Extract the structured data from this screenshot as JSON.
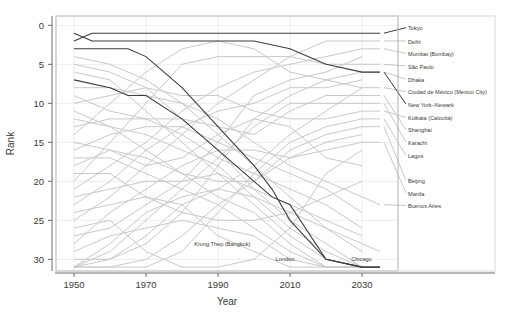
{
  "chart_data": {
    "type": "line",
    "title": "",
    "xlabel": "Year",
    "ylabel": "Rank",
    "xlim": [
      1945,
      2040
    ],
    "ylim": [
      31.5,
      -1.2
    ],
    "y_inverted": true,
    "grid": true,
    "legend_position": "right-of-plot (direct line labels)",
    "xticks": [
      1950,
      1970,
      1990,
      2010,
      2030
    ],
    "yticks": [
      0,
      5,
      10,
      15,
      20,
      25,
      30
    ],
    "colors": {
      "highlight": "#3d3d3d",
      "muted": "#c9c9c9",
      "axis": "#6d6d6d",
      "grid": "#ededf2",
      "frame": "#b0b0b0",
      "text": "#3a3a3a"
    },
    "series": [
      {
        "name": "Tokyo",
        "highlight": true,
        "label_rank": 0.3,
        "x": [
          1950,
          1955,
          1960,
          1970,
          1980,
          1990,
          2000,
          2010,
          2020,
          2030,
          2035
        ],
        "values": [
          2,
          1,
          1,
          1,
          1,
          1,
          1,
          1,
          1,
          1,
          1
        ]
      },
      {
        "name": "Delhi",
        "highlight": false,
        "label_rank": 2.0,
        "x": [
          1950,
          1960,
          1970,
          1980,
          1990,
          2000,
          2010,
          2020,
          2030,
          2035
        ],
        "values": [
          25,
          22,
          18,
          14,
          10,
          7,
          4,
          2,
          2,
          2
        ]
      },
      {
        "name": "Mumbai (Bombay)",
        "highlight": false,
        "label_rank": 3.6,
        "x": [
          1950,
          1960,
          1970,
          1980,
          1990,
          2000,
          2010,
          2020,
          2030,
          2035
        ],
        "values": [
          21,
          18,
          15,
          11,
          8,
          6,
          5,
          4,
          3,
          3
        ]
      },
      {
        "name": "São Paulo",
        "highlight": false,
        "label_rank": 5.2,
        "x": [
          1950,
          1960,
          1970,
          1980,
          1990,
          2000,
          2010,
          2020,
          2030,
          2035
        ],
        "values": [
          20,
          15,
          10,
          5,
          4,
          4,
          4,
          5,
          5,
          5
        ]
      },
      {
        "name": "Dhaka",
        "highlight": false,
        "label_rank": 6.9,
        "x": [
          1950,
          1960,
          1970,
          1980,
          1990,
          2000,
          2010,
          2020,
          2030,
          2035
        ],
        "values": [
          30,
          30,
          28,
          24,
          18,
          12,
          9,
          7,
          6,
          6
        ]
      },
      {
        "name": "Ciudad de México (Mexico City)",
        "highlight": false,
        "label_rank": 8.5,
        "x": [
          1950,
          1960,
          1970,
          1980,
          1990,
          2000,
          2010,
          2020,
          2030,
          2035
        ],
        "values": [
          14,
          10,
          6,
          3,
          2,
          3,
          6,
          7,
          8,
          8
        ]
      },
      {
        "name": "New York–Newark",
        "highlight": true,
        "label_rank": 10.1,
        "x": [
          1950,
          1955,
          1960,
          1970,
          1980,
          1990,
          2000,
          2010,
          2020,
          2030,
          2035
        ],
        "values": [
          1,
          2,
          2,
          2,
          2,
          2,
          2,
          3,
          5,
          6,
          6
        ]
      },
      {
        "name": "Kolkata (Calcutta)",
        "highlight": false,
        "label_rank": 11.8,
        "x": [
          1950,
          1960,
          1970,
          1980,
          1990,
          2000,
          2010,
          2020,
          2030,
          2035
        ],
        "values": [
          10,
          9,
          8,
          9,
          9,
          11,
          12,
          12,
          11,
          11
        ]
      },
      {
        "name": "Shanghai",
        "highlight": false,
        "label_rank": 13.4,
        "x": [
          1950,
          1960,
          1970,
          1980,
          1990,
          2000,
          2010,
          2020,
          2030,
          2035
        ],
        "values": [
          9,
          11,
          12,
          12,
          13,
          14,
          11,
          9,
          9,
          9
        ]
      },
      {
        "name": "Karachi",
        "highlight": false,
        "label_rank": 15.0,
        "x": [
          1950,
          1960,
          1970,
          1980,
          1990,
          2000,
          2010,
          2020,
          2030,
          2035
        ],
        "values": [
          31,
          29,
          25,
          21,
          17,
          13,
          10,
          10,
          10,
          10
        ]
      },
      {
        "name": "Lagos",
        "highlight": false,
        "label_rank": 16.7,
        "x": [
          1950,
          1960,
          1970,
          1980,
          1990,
          2000,
          2010,
          2020,
          2030,
          2035
        ],
        "values": [
          31,
          31,
          31,
          29,
          24,
          19,
          15,
          13,
          12,
          12
        ]
      },
      {
        "name": "Beijing",
        "highlight": false,
        "label_rank": 19.9,
        "x": [
          1950,
          1960,
          1970,
          1980,
          1990,
          2000,
          2010,
          2020,
          2030,
          2035
        ],
        "values": [
          18,
          16,
          17,
          19,
          20,
          20,
          16,
          14,
          13,
          13
        ]
      },
      {
        "name": "Manila",
        "highlight": false,
        "label_rank": 21.5,
        "x": [
          1950,
          1960,
          1970,
          1980,
          1990,
          2000,
          2010,
          2020,
          2030,
          2035
        ],
        "values": [
          28,
          24,
          21,
          18,
          16,
          16,
          17,
          16,
          15,
          15
        ]
      },
      {
        "name": "Buenos Aires",
        "highlight": false,
        "label_rank": 23.1,
        "x": [
          1950,
          1960,
          1970,
          1980,
          1990,
          2000,
          2010,
          2020,
          2030,
          2035
        ],
        "values": [
          8,
          8,
          9,
          10,
          12,
          15,
          18,
          20,
          22,
          23
        ]
      },
      {
        "name": "Krung Thep (Bangkok)",
        "highlight": false,
        "label_rank": 28.0,
        "label_x": 1999,
        "label_anchor": "end",
        "x": [
          1950,
          1960,
          1970,
          1980,
          1990,
          2000,
          2010,
          2020,
          2030,
          2035
        ],
        "values": [
          31,
          30,
          27,
          23,
          21,
          22,
          24,
          26,
          28,
          29
        ]
      },
      {
        "name": "London",
        "highlight": true,
        "label_rank": 29.9,
        "label_x": 2006,
        "label_anchor": "start",
        "x": [
          1950,
          1960,
          1965,
          1970,
          1980,
          1990,
          2000,
          2005,
          2010,
          2020,
          2030,
          2035
        ],
        "values": [
          3,
          3,
          3,
          4,
          8,
          13,
          18,
          21,
          25,
          30,
          31,
          31
        ]
      },
      {
        "name": "Chicago",
        "highlight": true,
        "label_rank": 29.9,
        "label_x": 2027,
        "label_anchor": "start",
        "x": [
          1950,
          1960,
          1965,
          1970,
          1980,
          1990,
          2000,
          2005,
          2010,
          2020,
          2030,
          2035
        ],
        "values": [
          7,
          8,
          9,
          9,
          12,
          16,
          20,
          22,
          23,
          30,
          31,
          31
        ]
      }
    ],
    "muted_background_series": [
      {
        "x": [
          1950,
          1960,
          1970,
          1980,
          1990,
          2000,
          2010,
          2020,
          2030
        ],
        "values": [
          4,
          5,
          7,
          10,
          14,
          18,
          22,
          26,
          29
        ]
      },
      {
        "x": [
          1950,
          1960,
          1970,
          1980,
          1990,
          2000,
          2010,
          2020,
          2030
        ],
        "values": [
          5,
          6,
          8,
          12,
          16,
          21,
          25,
          28,
          31
        ]
      },
      {
        "x": [
          1950,
          1960,
          1970,
          1980,
          1990,
          2000,
          2010,
          2020,
          2030
        ],
        "values": [
          6,
          7,
          11,
          15,
          19,
          23,
          27,
          30,
          31
        ]
      },
      {
        "x": [
          1950,
          1960,
          1970,
          1980,
          1990,
          2000,
          2010,
          2020,
          2030
        ],
        "values": [
          12,
          13,
          14,
          16,
          18,
          22,
          26,
          29,
          31
        ]
      },
      {
        "x": [
          1950,
          1960,
          1970,
          1980,
          1990,
          2000,
          2010,
          2020,
          2030
        ],
        "values": [
          16,
          14,
          13,
          13,
          15,
          17,
          19,
          21,
          24
        ]
      },
      {
        "x": [
          1950,
          1960,
          1970,
          1980,
          1990,
          2000,
          2010,
          2020,
          2030
        ],
        "values": [
          23,
          20,
          16,
          13,
          11,
          10,
          8,
          8,
          7
        ]
      },
      {
        "x": [
          1950,
          1960,
          1970,
          1980,
          1990,
          2000,
          2010,
          2020,
          2030
        ],
        "values": [
          27,
          26,
          23,
          20,
          15,
          9,
          7,
          6,
          4
        ]
      },
      {
        "x": [
          1950,
          1960,
          1970,
          1980,
          1990,
          2000,
          2010,
          2020,
          2030
        ],
        "values": [
          31,
          28,
          24,
          22,
          21,
          18,
          14,
          11,
          8
        ]
      },
      {
        "x": [
          1950,
          1960,
          1970,
          1980,
          1990,
          2000,
          2010,
          2020,
          2030
        ],
        "values": [
          31,
          31,
          30,
          27,
          23,
          20,
          17,
          15,
          14
        ]
      },
      {
        "x": [
          1950,
          1960,
          1970,
          1980,
          1990,
          2000,
          2010,
          2020,
          2030
        ],
        "values": [
          13,
          12,
          12,
          14,
          17,
          19,
          21,
          23,
          26
        ]
      },
      {
        "x": [
          1950,
          1960,
          1970,
          1980,
          1990,
          2000,
          2010,
          2020,
          2030
        ],
        "values": [
          11,
          13,
          16,
          19,
          22,
          24,
          28,
          31,
          31
        ]
      },
      {
        "x": [
          1950,
          1960,
          1970,
          1980,
          1990,
          2000,
          2010,
          2020,
          2030
        ],
        "values": [
          17,
          17,
          19,
          21,
          23,
          26,
          29,
          31,
          31
        ]
      },
      {
        "x": [
          1950,
          1960,
          1970,
          1980,
          1990,
          2000,
          2010,
          2020,
          2030
        ],
        "values": [
          22,
          21,
          20,
          20,
          19,
          21,
          23,
          25,
          27
        ]
      },
      {
        "x": [
          1950,
          1960,
          1970,
          1980,
          1990,
          2000,
          2010,
          2020,
          2030
        ],
        "values": [
          29,
          27,
          26,
          25,
          26,
          27,
          30,
          31,
          31
        ]
      },
      {
        "x": [
          1950,
          1960,
          1970,
          1980,
          1990,
          2000,
          2010,
          2020,
          2030
        ],
        "values": [
          19,
          19,
          22,
          24,
          25,
          25,
          24,
          22,
          20
        ]
      },
      {
        "x": [
          1950,
          1960,
          1970,
          1980,
          1990,
          2000,
          2010,
          2020,
          2030
        ],
        "values": [
          24,
          23,
          22,
          23,
          27,
          29,
          31,
          31,
          31
        ]
      },
      {
        "x": [
          1950,
          1960,
          1970,
          1980,
          1990,
          2000,
          2010,
          2020,
          2030
        ],
        "values": [
          26,
          25,
          29,
          31,
          31,
          30,
          26,
          19,
          16
        ]
      },
      {
        "x": [
          1950,
          1960,
          1970,
          1980,
          1990,
          2000,
          2010,
          2020,
          2030
        ],
        "values": [
          15,
          16,
          18,
          17,
          14,
          12,
          13,
          17,
          18
        ]
      }
    ]
  },
  "axes": {
    "x_tick_labels": [
      "1950",
      "1970",
      "1990",
      "2010",
      "2030"
    ],
    "y_tick_labels": [
      "0",
      "5",
      "10",
      "15",
      "20",
      "25",
      "30"
    ],
    "x_axis_title": "Year",
    "y_axis_title": "Rank"
  }
}
